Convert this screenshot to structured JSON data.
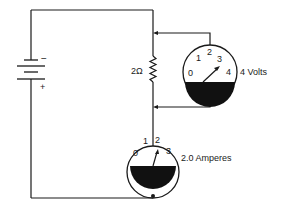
{
  "diagram": {
    "type": "circuit",
    "battery": {
      "minus_label": "−",
      "plus_label": "+"
    },
    "resistor": {
      "label": "2Ω"
    },
    "voltmeter": {
      "ticks": [
        "0",
        "1",
        "2",
        "3",
        "4"
      ],
      "reading_label": "4 Volts"
    },
    "ammeter": {
      "ticks": [
        "0",
        "1",
        "2",
        "3"
      ],
      "reading_label": "2.0 Amperes"
    },
    "colors": {
      "ink": "#1a1a1a",
      "background": "#ffffff"
    }
  }
}
